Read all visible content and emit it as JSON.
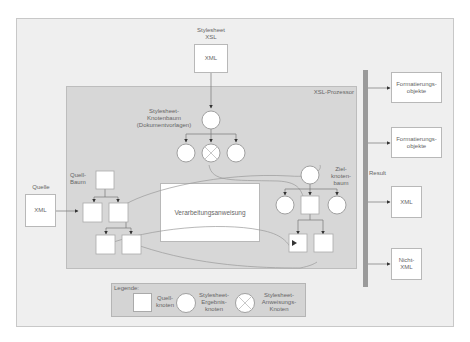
{
  "diagram": {
    "stylesheet_source": {
      "label": "Stylesheet\nXSL",
      "box_text": "XML"
    },
    "processor": {
      "title": "XSL-Prozessor"
    },
    "stylesheet_tree": {
      "label": "Stylesheet-\nKnotenbaum\n(Dokumentvorlagen)"
    },
    "source": {
      "label": "Quelle",
      "box_text": "XML"
    },
    "source_tree": {
      "label": "Quell-\nBaum"
    },
    "processing": {
      "label": "Verarbeitungsanweisung"
    },
    "target_tree": {
      "label": "Ziel-\nknoten-\nbaum"
    },
    "result": {
      "label": "Result"
    },
    "outputs": [
      {
        "label": "Formatierungs-\nobjekte"
      },
      {
        "label": "Formatierungs-\nobjekte"
      },
      {
        "label": "XML"
      },
      {
        "label": "Nicht-\nXML"
      }
    ],
    "legend": {
      "title": "Legende:",
      "items": [
        {
          "shape": "square",
          "label": "Quell-\nknoten"
        },
        {
          "shape": "circle",
          "label": "Stylesheet-\nErgebnis-\nknoten"
        },
        {
          "shape": "crossed-circle",
          "label": "Stylesheet-\nAnweisungs-\nKnoten"
        }
      ]
    }
  },
  "colors": {
    "outer_bg": "#efefef",
    "processor_bg": "#d7d7d7",
    "result_bar": "#9a9a9a",
    "node_fill": "#ffffff",
    "connector": "#777777"
  }
}
